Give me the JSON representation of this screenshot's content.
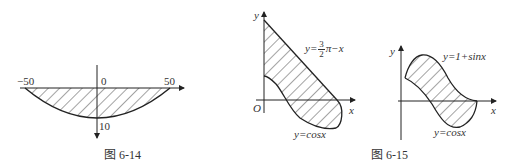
{
  "figures": [
    {
      "id": "fig-6-14",
      "caption": "图 6-14",
      "x_labels": [
        "−50",
        "0",
        "50"
      ],
      "y_label_bottom": "10",
      "curve": "parabola through (−50,0), (0,10), (50,0) with downward y-axis",
      "region": "shaded between x-axis and parabola"
    },
    {
      "id": "fig-6-15",
      "caption": "图 6-15",
      "left_panel": {
        "axis_x": "x",
        "axis_y": "y",
        "origin": "O",
        "line_label_prefix": "y=",
        "line_label_num": "3",
        "line_label_den": "2",
        "line_label_suffix": "π−x",
        "curve_label": "y=cosx"
      },
      "right_panel": {
        "axis_x": "x",
        "axis_y": "y",
        "upper_label": "y=1+sinx",
        "lower_label": "y=cosx"
      }
    }
  ]
}
